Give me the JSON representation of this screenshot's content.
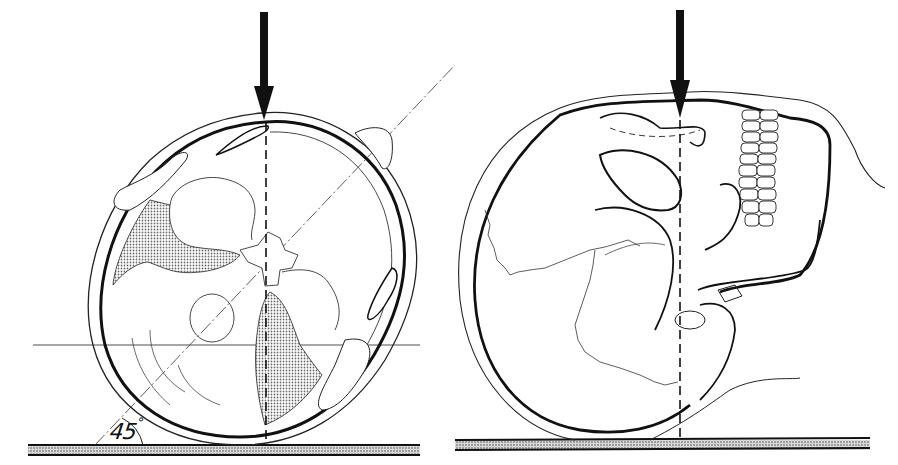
{
  "figure": {
    "type": "anatomical-line-drawing",
    "panels": [
      {
        "id": "left",
        "description": "Skull viewed from above, rotated 45 degrees, resting on a surface",
        "force_arrow": {
          "direction": "down",
          "x": 264
        },
        "annotations": {
          "angle_value": "45",
          "angle_unit": "°"
        },
        "shaded_regions": 2,
        "reference_lines": [
          "vertical dashed load line",
          "horizontal baseline",
          "45-degree dash-dot axis"
        ]
      },
      {
        "id": "right",
        "description": "Skull in lateral view, face turned upward, resting on occiput on a surface",
        "force_arrow": {
          "direction": "down",
          "x": 680
        },
        "reference_lines": [
          "vertical dashed load line"
        ]
      }
    ],
    "colors": {
      "ink": "#111111",
      "shading": "#bdbdbd",
      "floor_fill": "#c8c8c8",
      "background": "#ffffff"
    }
  }
}
